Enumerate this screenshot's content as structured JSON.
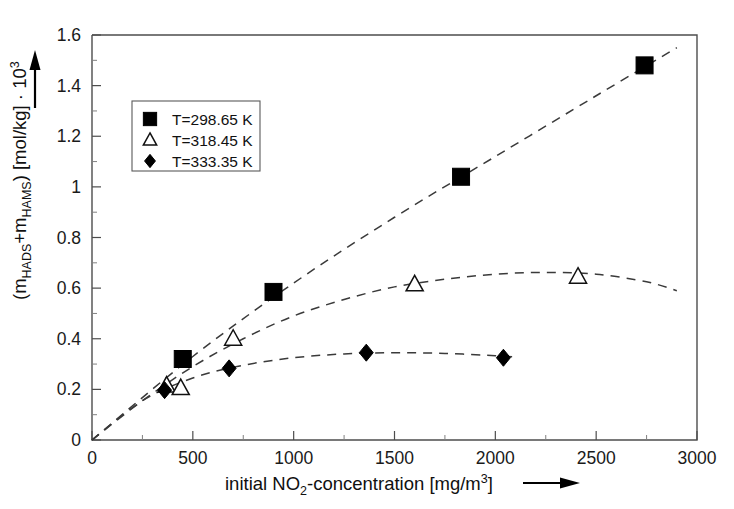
{
  "chart_data": {
    "type": "scatter",
    "title": "",
    "xlabel": "initial NO2-concentration [mg/m3]",
    "xlabel_parts": {
      "prefix": "initial NO",
      "sub": "2",
      "mid": "-concentration [mg/m",
      "sup": "3",
      "suffix": "]"
    },
    "ylabel": "(mHADS+mHAMS) [mol/kg] · 10^3",
    "ylabel_parts": {
      "open": "(m",
      "sub1": "HADS",
      "plus": "+m",
      "sub2": "HAMS",
      "close": ") [mol/kg] · 10",
      "sup": "3"
    },
    "xlim": [
      0,
      3000
    ],
    "ylim": [
      0,
      1.6
    ],
    "grid": false,
    "x_ticks": [
      0,
      500,
      1000,
      1500,
      2000,
      2500,
      3000
    ],
    "x_tick_labels": [
      "0",
      "500",
      "1000",
      "1500",
      "2000",
      "2500",
      "3000"
    ],
    "x_minor_ticks": [
      250,
      750,
      1250,
      1750,
      2250,
      2750
    ],
    "y_ticks": [
      0,
      0.2,
      0.4,
      0.6,
      0.8,
      1,
      1.2,
      1.4,
      1.6
    ],
    "y_tick_labels": [
      "0",
      "0.2",
      "0.4",
      "0.6",
      "0.8",
      "1",
      "1.2",
      "1.4",
      "1.6"
    ],
    "y_minor_ticks": [
      0.1,
      0.3,
      0.5,
      0.7,
      0.9,
      1.1,
      1.3,
      1.5
    ],
    "legend_position": "upper-left-inside",
    "series": [
      {
        "name": "T=298.65 K",
        "marker": "filled-square",
        "color": "#000000",
        "x": [
          450,
          900,
          1830,
          2740
        ],
        "y": [
          0.32,
          0.585,
          1.04,
          1.48
        ],
        "fit_x": [
          0,
          500,
          1000,
          1500,
          2000,
          2500,
          2900
        ],
        "fit_y": [
          0,
          0.33,
          0.62,
          0.88,
          1.12,
          1.36,
          1.55
        ]
      },
      {
        "name": "T=318.45 K",
        "marker": "open-triangle",
        "color": "#111111",
        "x": [
          370,
          440,
          700,
          1600,
          2410
        ],
        "y": [
          0.215,
          0.205,
          0.4,
          0.615,
          0.645
        ],
        "fit_x": [
          0,
          250,
          500,
          750,
          1000,
          1250,
          1500,
          1750,
          2000,
          2250,
          2500,
          2750,
          2900
        ],
        "fit_y": [
          0,
          0.155,
          0.29,
          0.4,
          0.49,
          0.555,
          0.605,
          0.635,
          0.655,
          0.662,
          0.655,
          0.625,
          0.59
        ]
      },
      {
        "name": "T=333.35 K",
        "marker": "filled-diamond",
        "color": "#000000",
        "x": [
          360,
          680,
          1360,
          2040
        ],
        "y": [
          0.197,
          0.283,
          0.345,
          0.325
        ],
        "fit_x": [
          0,
          250,
          500,
          750,
          1000,
          1250,
          1500,
          1750,
          2000,
          2100
        ],
        "fit_y": [
          0,
          0.155,
          0.245,
          0.295,
          0.325,
          0.34,
          0.345,
          0.342,
          0.333,
          0.328
        ]
      }
    ]
  },
  "legend": {
    "entries": [
      {
        "label": "T=298.65 K",
        "marker": "filled-square"
      },
      {
        "label": "T=318.45 K",
        "marker": "open-triangle"
      },
      {
        "label": "T=333.35 K",
        "marker": "filled-diamond"
      }
    ]
  },
  "annotations": {
    "y_axis_arrow": "up-arrow",
    "x_axis_arrow": "right-arrow"
  }
}
